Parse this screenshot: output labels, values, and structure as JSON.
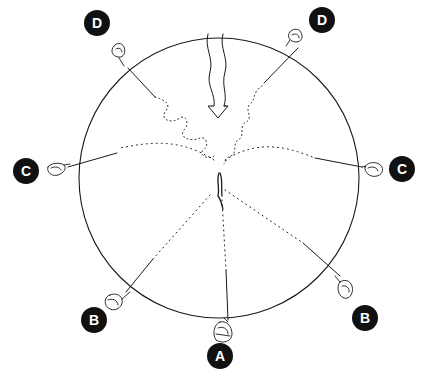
{
  "diagram": {
    "colors": {
      "ink": "#1a1a1a",
      "badge_bg": "#111111",
      "badge_text": "#ffffff",
      "background": "#ffffff"
    },
    "circle": {
      "cx": 219,
      "cy": 178,
      "r": 140
    },
    "labels": [
      {
        "id": "A",
        "text": "A",
        "x": 207,
        "y": 343
      },
      {
        "id": "B-left",
        "text": "B",
        "x": 81,
        "y": 307
      },
      {
        "id": "B-right",
        "text": "B",
        "x": 352,
        "y": 305
      },
      {
        "id": "C-left",
        "text": "C",
        "x": 13,
        "y": 158
      },
      {
        "id": "C-right",
        "text": "C",
        "x": 389,
        "y": 156
      },
      {
        "id": "D-left",
        "text": "D",
        "x": 84,
        "y": 10
      },
      {
        "id": "D-right",
        "text": "D",
        "x": 309,
        "y": 7
      }
    ]
  }
}
